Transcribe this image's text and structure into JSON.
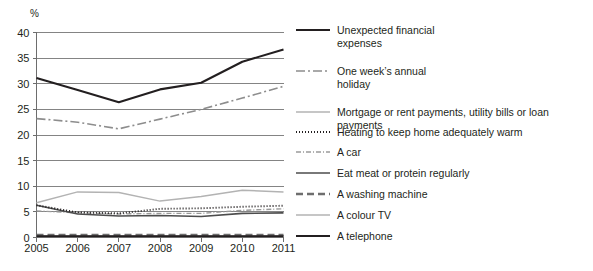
{
  "chart_data": {
    "type": "line",
    "title": "",
    "subtitle": "",
    "xlabel": "",
    "ylabel": "%",
    "y_unit_label": "%",
    "x": [
      "2005",
      "2006",
      "2007",
      "2008",
      "2009",
      "2010",
      "2011"
    ],
    "xlim": [
      2005,
      2011
    ],
    "ylim": [
      0,
      40
    ],
    "yticks": [
      0,
      5,
      10,
      15,
      20,
      25,
      30,
      35,
      40
    ],
    "ytick_labels": [
      "0",
      "5",
      "10",
      "15",
      "20",
      "25",
      "30",
      "35",
      "40"
    ],
    "xtick_labels": [
      "2005",
      "2006",
      "2007",
      "2008",
      "2009",
      "2010",
      "2011"
    ],
    "grid": "horizontal",
    "legend_position": "right",
    "series": [
      {
        "name": "Unexpected financial expenses",
        "label": "Unexpected financial\nexpenses",
        "values": [
          31.1,
          28.8,
          26.4,
          28.9,
          30.2,
          34.3,
          36.7
        ],
        "color": "#231f20",
        "width": 2.1,
        "dash": "none"
      },
      {
        "name": "One week's annual holiday",
        "label": "One week’s annual\nholiday",
        "values": [
          23.2,
          22.5,
          21.2,
          23.1,
          25.0,
          27.2,
          29.5
        ],
        "color": "#8d8d8d",
        "width": 1.6,
        "dash": "9,3,2,3"
      },
      {
        "name": "Mortgage or rent payments, utility bills or loan payments",
        "label": "Mortgage or rent payments, utility bills or loan payments",
        "values": [
          6.8,
          8.9,
          8.8,
          7.1,
          8.0,
          9.2,
          8.9
        ],
        "color": "#b3b3b3",
        "width": 1.5,
        "dash": "none"
      },
      {
        "name": "Heating to keep home adequately warm",
        "label": "Heating to keep home adequately warm",
        "values": [
          6.3,
          4.9,
          4.7,
          5.6,
          5.7,
          6.0,
          6.2
        ],
        "color": "#231f20",
        "width": 1.9,
        "dash": "1,2"
      },
      {
        "name": "A car",
        "label": "A car",
        "values": [
          5.2,
          4.8,
          4.6,
          4.7,
          4.7,
          5.3,
          5.6
        ],
        "color": "#9a9a9a",
        "width": 1.4,
        "dash": "5,2,1,2"
      },
      {
        "name": "Eat meat or protein regularly",
        "label": "Eat meat or protein regularly",
        "values": [
          6.3,
          4.6,
          4.2,
          4.3,
          4.1,
          4.7,
          4.8
        ],
        "color": "#4d4d4d",
        "width": 1.6,
        "dash": "none"
      },
      {
        "name": "A washing machine",
        "label": "A washing machine",
        "values": [
          0.5,
          0.5,
          0.5,
          0.5,
          0.5,
          0.5,
          0.5
        ],
        "color": "#6e6e6e",
        "width": 2.4,
        "dash": "7,4"
      },
      {
        "name": "A colour TV",
        "label": "A colour TV",
        "values": [
          0.35,
          0.35,
          0.35,
          0.35,
          0.35,
          0.35,
          0.35
        ],
        "color": "#b3b3b3",
        "width": 1.5,
        "dash": "none"
      },
      {
        "name": "A telephone",
        "label": "A telephone",
        "values": [
          0.25,
          0.25,
          0.25,
          0.25,
          0.25,
          0.25,
          0.25
        ],
        "color": "#231f20",
        "width": 1.8,
        "dash": "none"
      }
    ]
  },
  "colors": {
    "axis": "#6d6d6d",
    "gridline": "#777777",
    "text": "#231f20",
    "background": "#ffffff"
  }
}
